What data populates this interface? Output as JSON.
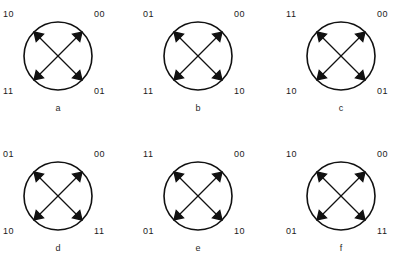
{
  "figure": {
    "kind": "state-transition-diagram-grid",
    "rows": 2,
    "columns": 3,
    "colors": {
      "background": "#ffffff",
      "stroke": "#111111",
      "text": "#1b1b1b"
    },
    "arrow_style": "double-headed",
    "diagrams": [
      {
        "caption": "a",
        "nodes": {
          "top_left": "10",
          "top_right": "00",
          "bottom_left": "11",
          "bottom_right": "01"
        },
        "edges": [
          {
            "from": "top_left",
            "to": "bottom_right",
            "heads": "both"
          },
          {
            "from": "top_right",
            "to": "bottom_left",
            "heads": "both"
          }
        ]
      },
      {
        "caption": "b",
        "nodes": {
          "top_left": "01",
          "top_right": "00",
          "bottom_left": "11",
          "bottom_right": "10"
        },
        "edges": [
          {
            "from": "top_left",
            "to": "bottom_right",
            "heads": "both"
          },
          {
            "from": "top_right",
            "to": "bottom_left",
            "heads": "both"
          }
        ]
      },
      {
        "caption": "c",
        "nodes": {
          "top_left": "11",
          "top_right": "00",
          "bottom_left": "10",
          "bottom_right": "01"
        },
        "edges": [
          {
            "from": "top_left",
            "to": "bottom_right",
            "heads": "both"
          },
          {
            "from": "top_right",
            "to": "bottom_left",
            "heads": "both"
          }
        ]
      },
      {
        "caption": "d",
        "nodes": {
          "top_left": "01",
          "top_right": "00",
          "bottom_left": "10",
          "bottom_right": "11"
        },
        "edges": [
          {
            "from": "top_left",
            "to": "bottom_right",
            "heads": "both"
          },
          {
            "from": "top_right",
            "to": "bottom_left",
            "heads": "both"
          }
        ]
      },
      {
        "caption": "e",
        "nodes": {
          "top_left": "11",
          "top_right": "00",
          "bottom_left": "01",
          "bottom_right": "10"
        },
        "edges": [
          {
            "from": "top_left",
            "to": "bottom_right",
            "heads": "both"
          },
          {
            "from": "top_right",
            "to": "bottom_left",
            "heads": "both"
          }
        ]
      },
      {
        "caption": "f",
        "nodes": {
          "top_left": "10",
          "top_right": "00",
          "bottom_left": "01",
          "bottom_right": "11"
        },
        "edges": [
          {
            "from": "top_left",
            "to": "bottom_right",
            "heads": "both"
          },
          {
            "from": "top_right",
            "to": "bottom_left",
            "heads": "both"
          }
        ]
      }
    ]
  }
}
